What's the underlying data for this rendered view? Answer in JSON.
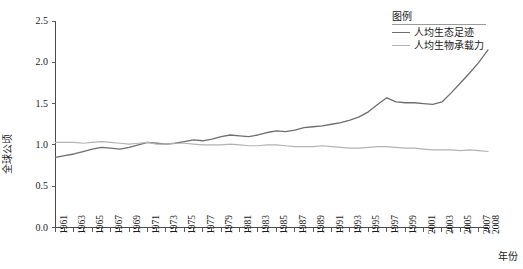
{
  "chart_data": {
    "type": "line",
    "title": "",
    "xlabel": "年份",
    "ylabel": "全球公顷",
    "xlim": [
      1961,
      2008
    ],
    "ylim": [
      0.0,
      2.5
    ],
    "grid": false,
    "legend_position": "top-right",
    "legend_title": "图例",
    "y_ticks": [
      "0.0",
      "0.5",
      "1.0",
      "1.5",
      "2.0",
      "2.5"
    ],
    "y_tick_values": [
      0.0,
      0.5,
      1.0,
      1.5,
      2.0,
      2.5
    ],
    "x_tick_labels": [
      "1961",
      "1963",
      "1965",
      "1967",
      "1969",
      "1971",
      "1973",
      "1975",
      "1977",
      "1979",
      "1981",
      "1983",
      "1985",
      "1987",
      "1989",
      "1991",
      "1993",
      "1995",
      "1997",
      "1999",
      "2001",
      "2003",
      "2005",
      "2007",
      "2008"
    ],
    "x_tick_values": [
      1961,
      1963,
      1965,
      1967,
      1969,
      1971,
      1973,
      1975,
      1977,
      1979,
      1981,
      1983,
      1985,
      1987,
      1989,
      1991,
      1993,
      1995,
      1997,
      1999,
      2001,
      2003,
      2005,
      2007,
      2008
    ],
    "x": [
      1961,
      1962,
      1963,
      1964,
      1965,
      1966,
      1967,
      1968,
      1969,
      1970,
      1971,
      1972,
      1973,
      1974,
      1975,
      1976,
      1977,
      1978,
      1979,
      1980,
      1981,
      1982,
      1983,
      1984,
      1985,
      1986,
      1987,
      1988,
      1989,
      1990,
      1991,
      1992,
      1993,
      1994,
      1995,
      1996,
      1997,
      1998,
      1999,
      2000,
      2001,
      2002,
      2003,
      2004,
      2005,
      2006,
      2007,
      2008
    ],
    "series": [
      {
        "name": "人均生态足迹",
        "color": "#6e6e6e",
        "values": [
          0.85,
          0.87,
          0.89,
          0.92,
          0.95,
          0.97,
          0.96,
          0.95,
          0.97,
          1.0,
          1.03,
          1.02,
          1.01,
          1.02,
          1.04,
          1.06,
          1.05,
          1.07,
          1.1,
          1.12,
          1.11,
          1.1,
          1.12,
          1.15,
          1.17,
          1.16,
          1.18,
          1.21,
          1.22,
          1.23,
          1.25,
          1.27,
          1.3,
          1.34,
          1.4,
          1.49,
          1.57,
          1.52,
          1.51,
          1.51,
          1.5,
          1.49,
          1.52,
          1.63,
          1.75,
          1.87,
          2.0,
          2.15
        ]
      },
      {
        "name": "人均生物承载力",
        "color": "#b3b3b3",
        "values": [
          1.03,
          1.03,
          1.03,
          1.02,
          1.03,
          1.04,
          1.03,
          1.02,
          1.01,
          1.02,
          1.03,
          1.01,
          1.01,
          1.02,
          1.02,
          1.01,
          1.0,
          1.0,
          1.0,
          1.01,
          1.0,
          0.99,
          0.99,
          1.0,
          1.0,
          0.99,
          0.98,
          0.98,
          0.98,
          0.99,
          0.98,
          0.97,
          0.96,
          0.96,
          0.97,
          0.98,
          0.98,
          0.97,
          0.96,
          0.96,
          0.95,
          0.94,
          0.94,
          0.94,
          0.93,
          0.94,
          0.93,
          0.92
        ]
      }
    ]
  }
}
